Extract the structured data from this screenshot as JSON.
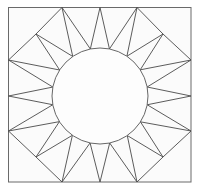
{
  "diagram": {
    "title": "",
    "spike_count": 16,
    "colors": {
      "stroke": "#4a4a4a",
      "background": "#ffffff",
      "fill": "#fbfbfb"
    }
  }
}
